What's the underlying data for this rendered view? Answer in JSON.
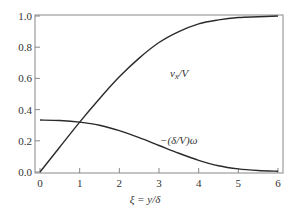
{
  "chart_data": {
    "type": "line",
    "title": "",
    "xlabel": "ξ = y/δ",
    "ylabel": "",
    "xlim": [
      0,
      6
    ],
    "ylim": [
      0,
      1.0
    ],
    "grid": false,
    "legend": "none (curves labeled inline)",
    "x_ticks": [
      "0",
      "1",
      "2",
      "3",
      "4",
      "5",
      "6"
    ],
    "y_ticks": [
      "0.0",
      "0.2",
      "0.4",
      "0.6",
      "0.8",
      "1.0"
    ],
    "series": [
      {
        "name": "v_x/V",
        "label_position": {
          "x": 3.3,
          "y": 0.8
        },
        "x": [
          0,
          0.5,
          1.0,
          1.5,
          2.0,
          2.5,
          3.0,
          3.5,
          4.0,
          4.5,
          5.0,
          5.5,
          6.0
        ],
        "values": [
          0.0,
          0.16,
          0.32,
          0.47,
          0.61,
          0.73,
          0.83,
          0.9,
          0.95,
          0.975,
          0.99,
          0.995,
          1.0
        ]
      },
      {
        "name": "−(δ/V)ω",
        "label_position": {
          "x": 3.7,
          "y": 0.13
        },
        "x": [
          0,
          0.5,
          1.0,
          1.5,
          2.0,
          2.5,
          3.0,
          3.5,
          4.0,
          4.5,
          5.0,
          5.5,
          6.0
        ],
        "values": [
          0.333,
          0.33,
          0.32,
          0.3,
          0.265,
          0.22,
          0.17,
          0.12,
          0.075,
          0.04,
          0.02,
          0.01,
          0.005
        ]
      }
    ]
  },
  "labels": {
    "curve1": "v",
    "curve1_sub": "x",
    "curve1_rest": "/V",
    "curve2": "−(δ/V)ω",
    "xlabel": "ξ = y/δ"
  }
}
